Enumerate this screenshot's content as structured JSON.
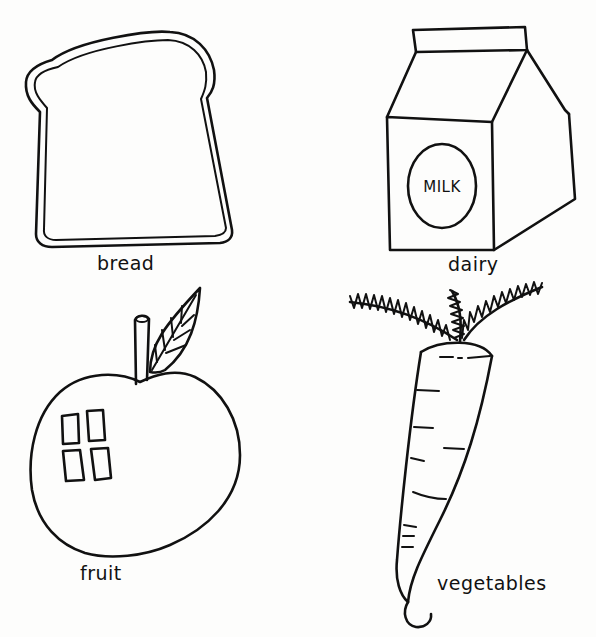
{
  "illustration": {
    "title": "Food groups",
    "ink_color": "#111111",
    "paper_color": "#fdfdfc",
    "items": [
      {
        "id": "bread",
        "label": "bread",
        "icon": "bread-slice-icon"
      },
      {
        "id": "dairy",
        "label": "dairy",
        "icon": "milk-carton-icon",
        "carton_text": "MILK"
      },
      {
        "id": "fruit",
        "label": "fruit",
        "icon": "apple-icon"
      },
      {
        "id": "vegetables",
        "label": "vegetables",
        "icon": "carrot-icon"
      }
    ]
  }
}
